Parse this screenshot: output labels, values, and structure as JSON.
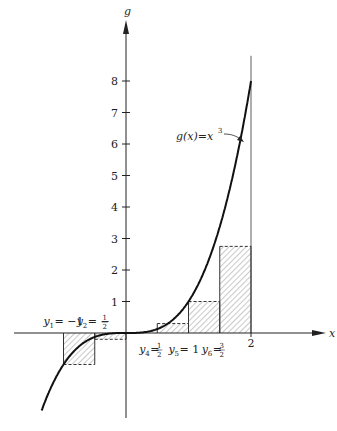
{
  "chart_data": {
    "type": "line",
    "title": "",
    "function_label": "g(x) = x^3",
    "function_label_parts": {
      "pre": "g(x)=x",
      "sup": "3"
    },
    "xlabel": "x",
    "ylabel": "g",
    "xlim": [
      -1.35,
      2
    ],
    "ylim": [
      -1.6,
      9
    ],
    "y_ticks": [
      1,
      2,
      3,
      4,
      5,
      6,
      7,
      8
    ],
    "y_tick_labels": [
      "1",
      "2",
      "3",
      "4",
      "5",
      "6",
      "7",
      "8"
    ],
    "x_tick_labels": [
      {
        "x": 2,
        "label": "2"
      }
    ],
    "rectangles": [
      {
        "x0": -1,
        "x1": -0.5,
        "height": -1
      },
      {
        "x0": -0.5,
        "x1": 0,
        "height": -0.2
      },
      {
        "x0": 0.5,
        "x1": 1,
        "height": 0.3
      },
      {
        "x0": 1,
        "x1": 1.5,
        "height": 1
      },
      {
        "x0": 1.5,
        "x1": 2,
        "height": 2.75
      }
    ],
    "point_labels": [
      {
        "x": -1,
        "sym": "y",
        "sub": "1",
        "val": "= −1",
        "position": "above"
      },
      {
        "x": -0.5,
        "sym": "y",
        "sub": "2",
        "val": "= −",
        "frac": [
          "1",
          "2"
        ],
        "position": "above"
      },
      {
        "x": 0.5,
        "sym": "y",
        "sub": "4",
        "val": "=",
        "frac": [
          "1",
          "2"
        ],
        "position": "below"
      },
      {
        "x": 1,
        "sym": "y",
        "sub": "5",
        "val": "= 1",
        "position": "below"
      },
      {
        "x": 1.5,
        "sym": "y",
        "sub": "6",
        "val": "=",
        "frac": [
          "3",
          "2"
        ],
        "position": "below"
      }
    ],
    "grid": false
  }
}
